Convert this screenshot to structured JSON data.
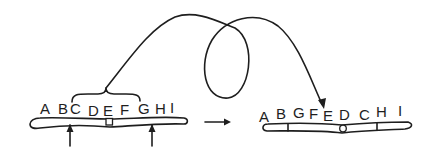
{
  "diagram": {
    "type": "chromosomal-inversion",
    "colors": {
      "ink": "#1e1e1e",
      "background": "#ffffff"
    },
    "before": {
      "genes": [
        "A",
        "B",
        "C",
        "D",
        "E",
        "F",
        "G",
        "H",
        "I"
      ],
      "inverted_segment": [
        "C",
        "D",
        "E",
        "F",
        "G"
      ],
      "breakpoint_markers": [
        "between B and C",
        "between G and H"
      ],
      "centromere": "square, between D and E"
    },
    "after": {
      "genes": [
        "A",
        "B",
        "G",
        "F",
        "E",
        "D",
        "C",
        "H",
        "I"
      ],
      "centromere": "circle, between E and D"
    },
    "transition_arrow": "right-arrow",
    "loop_arrow": "curved arrow with loop from bracketed segment to inverted segment"
  }
}
